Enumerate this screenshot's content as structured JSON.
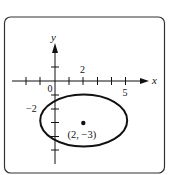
{
  "diagram": {
    "type": "ellipse-on-coordinate-plane",
    "frame": {
      "stroke": "#333333",
      "radius": 6
    },
    "axes": {
      "x_label": "x",
      "y_label": "y",
      "origin_label": "0",
      "x_tick_labels": [
        {
          "value": 2,
          "text": "2",
          "position": "above"
        },
        {
          "value": 5,
          "text": "5",
          "position": "below"
        }
      ],
      "y_tick_labels": [
        {
          "value": -2,
          "text": "−2",
          "position": "left"
        }
      ],
      "x_ticks": [
        -2,
        -1,
        1,
        2,
        3,
        4,
        5
      ],
      "y_ticks": [
        1,
        -1,
        -2,
        -3,
        -4,
        -5
      ]
    },
    "ellipse": {
      "center": [
        2,
        -3
      ],
      "semi_axis_x": 3.1,
      "semi_axis_y": 1.9,
      "stroke": "#111111"
    },
    "center_point": {
      "coords": [
        2,
        -3
      ],
      "label": "(2, −3)"
    }
  }
}
